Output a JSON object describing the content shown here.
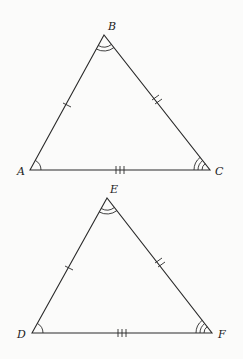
{
  "figure": {
    "triangles": [
      {
        "name": "ABC",
        "vertices": [
          {
            "label": "A",
            "x": 30,
            "y": 170
          },
          {
            "label": "B",
            "x": 104,
            "y": 35
          },
          {
            "label": "C",
            "x": 210,
            "y": 170
          }
        ],
        "side_marks": {
          "AB": 1,
          "BC": 2,
          "AC": 3
        },
        "angle_arcs": {
          "A": 1,
          "B": 2,
          "C": 3
        }
      },
      {
        "name": "DEF",
        "vertices": [
          {
            "label": "D",
            "x": 32,
            "y": 333
          },
          {
            "label": "E",
            "x": 107,
            "y": 198
          },
          {
            "label": "F",
            "x": 212,
            "y": 333
          }
        ],
        "side_marks": {
          "DE": 1,
          "EF": 2,
          "DF": 3
        },
        "angle_arcs": {
          "D": 1,
          "E": 2,
          "F": 3
        }
      }
    ]
  },
  "labels": {
    "A": "A",
    "B": "B",
    "C": "C",
    "D": "D",
    "E": "E",
    "F": "F"
  }
}
